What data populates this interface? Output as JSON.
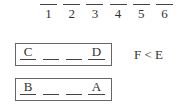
{
  "positions": [
    "1",
    "2",
    "3",
    "4",
    "5",
    "6"
  ],
  "groups": [
    {
      "cells": [
        "C",
        "",
        "",
        "D"
      ]
    },
    {
      "cells": [
        "B",
        "",
        "",
        "A"
      ]
    }
  ],
  "constraint": "F < E"
}
